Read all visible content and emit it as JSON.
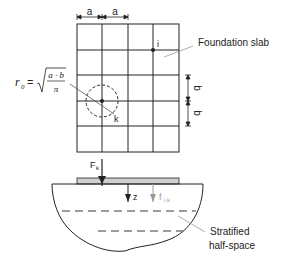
{
  "diagram": {
    "top_view": {
      "dim_a_labels": [
        "a",
        "a"
      ],
      "dim_b_labels": [
        "b",
        "b"
      ],
      "node_i_label": "i",
      "node_k_label": "k",
      "slab_label": "Foundation slab",
      "formula": {
        "lhs": "r",
        "lhs_sub": "0",
        "equals": "=",
        "numerator": "a · b",
        "denominator": "π"
      }
    },
    "section_view": {
      "force_label": "F",
      "force_sub": "k",
      "depth_label": "z",
      "stress_label": "f",
      "stress_sub": "i,k",
      "halfspace_label_line1": "Stratified",
      "halfspace_label_line2": "half-space"
    },
    "colors": {
      "line": "#222222",
      "slab_fill": "#cfcfcf",
      "gray_arrow": "#9a9a9a",
      "leader": "#888888"
    }
  }
}
